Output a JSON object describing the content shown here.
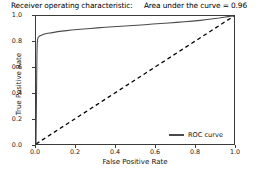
{
  "chart_data": {
    "type": "line",
    "title": "Receiver operating characteristic:     Area under the curve = 0.96",
    "title_main": "Receiver operating characteristic:",
    "auc_text": "Area under the curve = 0.96",
    "auc_value": 0.96,
    "xlabel": "False Positive Rate",
    "ylabel": "True Positive Rate",
    "xlim": [
      0.0,
      1.0
    ],
    "ylim": [
      0.0,
      1.0
    ],
    "xticks": [
      "0.0",
      "0.2",
      "0.4",
      "0.6",
      "0.8",
      "1.0"
    ],
    "yticks": [
      "0.0",
      "0.2",
      "0.4",
      "0.6",
      "0.8",
      "1.0"
    ],
    "xtick_values": [
      0.0,
      0.2,
      0.4,
      0.6,
      0.8,
      1.0
    ],
    "ytick_values": [
      0.0,
      0.2,
      0.4,
      0.6,
      0.8,
      1.0
    ],
    "grid": false,
    "legend_position": "lower right",
    "series": [
      {
        "name": "ROC curve",
        "style": "solid",
        "color": "#4a4a4a",
        "x": [
          0.0,
          0.002,
          0.004,
          0.005,
          0.006,
          0.008,
          0.01,
          0.014,
          0.018,
          0.024,
          0.03,
          0.038,
          0.048,
          0.06,
          0.075,
          0.09,
          0.11,
          0.13,
          0.155,
          0.18,
          0.21,
          0.24,
          0.275,
          0.31,
          0.35,
          0.39,
          0.43,
          0.47,
          0.51,
          0.55,
          0.59,
          0.63,
          0.67,
          0.71,
          0.75,
          0.79,
          0.83,
          0.865,
          0.895,
          0.925,
          0.95,
          0.97,
          0.985,
          1.0
        ],
        "y": [
          0.0,
          0.3,
          0.6,
          0.72,
          0.78,
          0.815,
          0.83,
          0.838,
          0.843,
          0.848,
          0.852,
          0.857,
          0.861,
          0.865,
          0.868,
          0.872,
          0.878,
          0.882,
          0.886,
          0.89,
          0.895,
          0.899,
          0.903,
          0.907,
          0.912,
          0.916,
          0.92,
          0.924,
          0.928,
          0.932,
          0.937,
          0.941,
          0.945,
          0.95,
          0.955,
          0.96,
          0.966,
          0.972,
          0.978,
          0.984,
          0.99,
          0.995,
          0.998,
          1.0
        ]
      },
      {
        "name": "chance-diagonal",
        "style": "dashed",
        "color": "#000000",
        "x": [
          0.0,
          1.0
        ],
        "y": [
          0.0,
          1.0
        ]
      }
    ],
    "legend": [
      {
        "label": "ROC curve",
        "color": "#4a4a4a",
        "style": "solid"
      }
    ]
  },
  "colors": {
    "curve": "#4a4a4a",
    "diagonal": "#000000",
    "axis": "#3a3a3a",
    "text": "#111111",
    "background": "#ffffff"
  }
}
